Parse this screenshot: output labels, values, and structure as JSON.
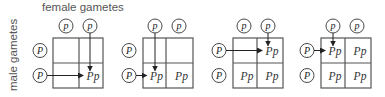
{
  "labels": {
    "female": "female gametes",
    "male": "male gametes"
  },
  "colors": {
    "grid_line": "#555555",
    "arrow": "#222222",
    "text": "#333333"
  },
  "panels": [
    {
      "female_gametes": [
        "p",
        "p"
      ],
      "male_gametes": [
        "P",
        "P"
      ],
      "cells": [
        [
          "",
          ""
        ],
        [
          "",
          "Pp"
        ]
      ],
      "arrow_target": {
        "row": 1,
        "col": 1
      },
      "arrow_from_female_col": 1,
      "arrow_from_male_row": 1
    },
    {
      "female_gametes": [
        "p",
        "p"
      ],
      "male_gametes": [
        "P",
        "P"
      ],
      "cells": [
        [
          "",
          ""
        ],
        [
          "Pp",
          "Pp"
        ]
      ],
      "arrow_target": {
        "row": 1,
        "col": 0
      },
      "arrow_from_female_col": 0,
      "arrow_from_male_row": 1
    },
    {
      "female_gametes": [
        "p",
        "p"
      ],
      "male_gametes": [
        "P",
        "P"
      ],
      "cells": [
        [
          "",
          "Pp"
        ],
        [
          "Pp",
          "Pp"
        ]
      ],
      "arrow_target": {
        "row": 0,
        "col": 1
      },
      "arrow_from_female_col": 1,
      "arrow_from_male_row": 0
    },
    {
      "female_gametes": [
        "p",
        "p"
      ],
      "male_gametes": [
        "P",
        "P"
      ],
      "cells": [
        [
          "Pp",
          "Pp"
        ],
        [
          "Pp",
          "Pp"
        ]
      ],
      "arrow_target": {
        "row": 0,
        "col": 0
      },
      "arrow_from_female_col": 0,
      "arrow_from_male_row": 0
    }
  ]
}
